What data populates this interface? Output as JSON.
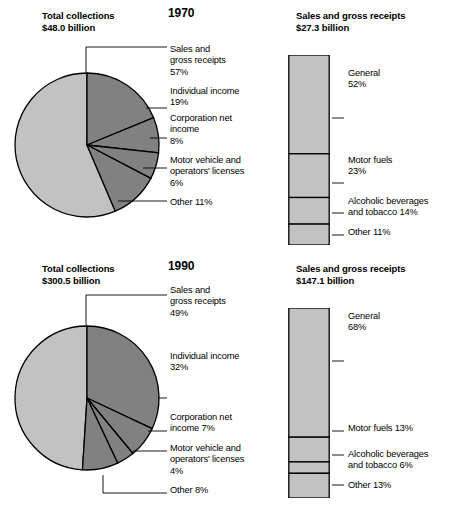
{
  "chart_data": [
    {
      "type": "pie",
      "title": "Total collections",
      "subtitle": "$48.0 billion",
      "year": "1970",
      "categories": [
        "Sales and gross receipts",
        "Individual income",
        "Corporation net income",
        "Motor vehicle and operators' licenses",
        "Other"
      ],
      "values": [
        57,
        19,
        8,
        6,
        11
      ],
      "unit": "%",
      "colors": [
        "#c2c2c2",
        "#818181",
        "#818181",
        "#818181",
        "#818181"
      ],
      "labels": [
        {
          "lines": [
            "Sales and",
            "gross receipts",
            "57%"
          ],
          "top": 44
        },
        {
          "lines": [
            "Individual income",
            "19%"
          ],
          "top": 86
        },
        {
          "lines": [
            "Corporation net",
            "income",
            "8%"
          ],
          "top": 113
        },
        {
          "lines": [
            "Motor vehicle and",
            "operators' licenses",
            "6%"
          ],
          "top": 155
        },
        {
          "lines": [
            "Other 11%"
          ],
          "top": 197
        }
      ]
    },
    {
      "type": "bar",
      "title": "Sales and gross receipts",
      "subtitle": "$27.3 billion",
      "year": "1970",
      "categories": [
        "General",
        "Motor fuels",
        "Alcoholic beverages and tobacco",
        "Other"
      ],
      "values": [
        52,
        23,
        14,
        11
      ],
      "unit": "%",
      "colors": [
        "#c2c2c2",
        "#c2c2c2",
        "#c2c2c2",
        "#c2c2c2"
      ],
      "labels": [
        {
          "lines": [
            "General",
            "52%"
          ],
          "top": 68
        },
        {
          "lines": [
            "Motor fuels",
            "23%"
          ],
          "top": 155
        },
        {
          "lines": [
            "Alcoholic beverages",
            "and tobacco 14%"
          ],
          "top": 196
        },
        {
          "lines": [
            "Other 11%"
          ],
          "top": 227
        }
      ]
    },
    {
      "type": "pie",
      "title": "Total collections",
      "subtitle": "$300.5 billion",
      "year": "1990",
      "categories": [
        "Sales and gross receipts",
        "Individual income",
        "Corporation net income",
        "Motor vehicle and operators' licenses",
        "Other"
      ],
      "values": [
        49,
        32,
        7,
        4,
        8
      ],
      "unit": "%",
      "colors": [
        "#c2c2c2",
        "#818181",
        "#818181",
        "#818181",
        "#818181"
      ],
      "labels": [
        {
          "lines": [
            "Sales and",
            "gross receipts",
            "49%"
          ],
          "top": 32
        },
        {
          "lines": [
            "Individual income",
            "32%"
          ],
          "top": 98
        },
        {
          "lines": [
            "Corporation net",
            "income 7%"
          ],
          "top": 159
        },
        {
          "lines": [
            "Motor vehicle and",
            "operators' licenses",
            "4%"
          ],
          "top": 190
        },
        {
          "lines": [
            "Other 8%"
          ],
          "top": 232
        }
      ]
    },
    {
      "type": "bar",
      "title": "Sales and gross receipts",
      "subtitle": "$147.1 billion",
      "year": "1990",
      "categories": [
        "General",
        "Motor fuels",
        "Alcoholic beverages and tobacco",
        "Other"
      ],
      "values": [
        68,
        13,
        6,
        13
      ],
      "unit": "%",
      "colors": [
        "#c2c2c2",
        "#c2c2c2",
        "#c2c2c2",
        "#c2c2c2"
      ],
      "labels": [
        {
          "lines": [
            "General",
            "68%"
          ],
          "top": 58
        },
        {
          "lines": [
            "Motor fuels 13%"
          ],
          "top": 170
        },
        {
          "lines": [
            "Alcoholic beverages",
            "and tobacco 6%"
          ],
          "top": 196
        },
        {
          "lines": [
            "Other 13%"
          ],
          "top": 227
        }
      ]
    }
  ],
  "panels": [
    {
      "id": "1970",
      "year": "1970",
      "left_title": "Total collections",
      "left_subtitle": "$48.0 billion",
      "right_title": "Sales and gross receipts",
      "right_subtitle": "$27.3 billion"
    },
    {
      "id": "1990",
      "year": "1990",
      "left_title": "Total collections",
      "left_subtitle": "$300.5 billion",
      "right_title": "Sales and gross receipts",
      "right_subtitle": "$147.1 billion"
    }
  ],
  "style": {
    "light_gray": "#c2c2c2",
    "dark_gray": "#818181",
    "outline": "#000000",
    "leader": "#000000",
    "background": "#ffffff"
  }
}
